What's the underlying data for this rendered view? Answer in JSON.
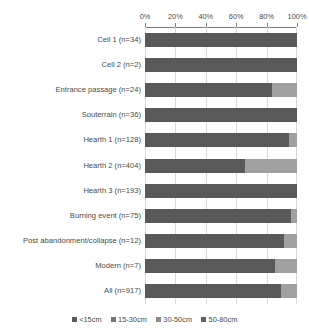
{
  "chart_data": {
    "type": "bar",
    "subtype": "100% stacked horizontal bar",
    "title": "",
    "xlabel": "",
    "ylabel": "",
    "xlim": [
      0,
      100
    ],
    "xticks": [
      "0%",
      "20%",
      "40%",
      "60%",
      "80%",
      "100%"
    ],
    "xtick_values": [
      0,
      20,
      40,
      60,
      80,
      100
    ],
    "grid": true,
    "legend_position": "bottom",
    "categories": [
      "Cell 1 (n=34)",
      "Cell 2 (n=2)",
      "Entrance passage (n=24)",
      "Souterrain (n=36)",
      "Hearth 1 (n=128)",
      "Hearth 2 (n=404)",
      "Hearth 3 (n=193)",
      "Burning event (n=75)",
      "Post abandonment/collapse (n=12)",
      "Modern (n=7)",
      "All (n=917)"
    ],
    "series": [
      {
        "name": "<15cm",
        "color": "#595959",
        "values": [
          100,
          100,
          83.3,
          100,
          94.5,
          65.8,
          100,
          96,
          91.7,
          85.7,
          89.5
        ]
      },
      {
        "name": "15-30cm",
        "color": "#a0a0a0",
        "values": [
          0,
          0,
          16.7,
          0,
          5.5,
          34.2,
          0,
          4,
          8.3,
          14.3,
          10.5
        ]
      },
      {
        "name": "30-50cm",
        "color": "#767676",
        "values": [
          0,
          0,
          0,
          0,
          0,
          0,
          0,
          0,
          0,
          0,
          0
        ]
      },
      {
        "name": "50-80cm",
        "color": "#4d4d4d",
        "values": [
          0,
          0,
          0,
          0,
          0,
          0,
          0,
          0,
          0,
          0,
          0
        ]
      }
    ]
  },
  "legend": {
    "items": [
      {
        "label": "<15cm",
        "color": "#595959"
      },
      {
        "label": "15-30cm",
        "color": "#757575"
      },
      {
        "label": "30-50cm",
        "color": "#8c8c8c"
      },
      {
        "label": "50-80cm",
        "color": "#5f5f5f"
      }
    ]
  },
  "colors": {
    "grid": "#d9d9d9",
    "axis": "#7f7f7f",
    "text": "#4a4a4a",
    "background": "#ffffff"
  }
}
